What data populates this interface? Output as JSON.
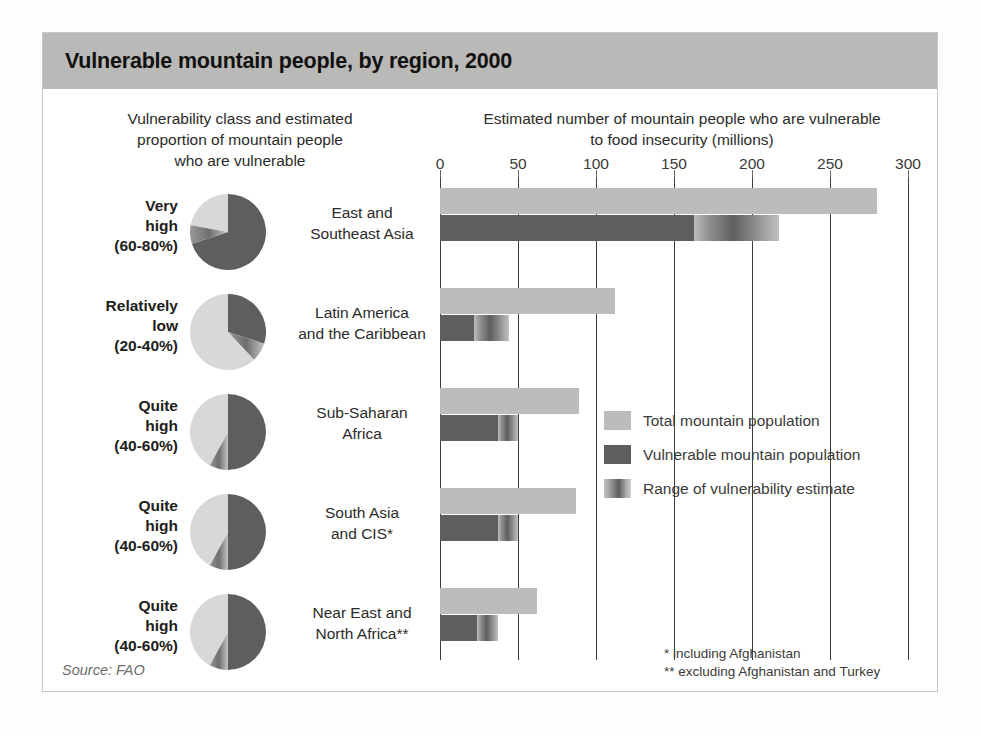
{
  "title": "Vulnerable mountain people, by region, 2000",
  "left_header": "Vulnerability class and estimated proportion of mountain people who are vulnerable",
  "left_header_lines": [
    "Vulnerability class and estimated",
    "proportion of mountain people",
    "who are vulnerable"
  ],
  "right_header_lines": [
    "Estimated number of mountain people who are vulnerable",
    "to food insecurity (millions)"
  ],
  "source": "Source: FAO",
  "footnotes": [
    "* including Afghanistan",
    "** excluding Afghanistan and Turkey"
  ],
  "legend": [
    {
      "key": "total",
      "label": "Total mountain population"
    },
    {
      "key": "vuln",
      "label": "Vulnerable mountain population"
    },
    {
      "key": "range",
      "label": "Range of vulnerability estimate"
    }
  ],
  "colors": {
    "title_band": "#b9b9b7",
    "total_bar": "#bcbcba",
    "vulnerable_bar": "#5e5e5c",
    "gridline": "#3d3d3b",
    "text": "#2b2b29"
  },
  "rows": [
    {
      "class_lines": [
        "Very",
        "high",
        "(60-80%)"
      ],
      "class_name": "Very high",
      "class_range": "(60-80%)",
      "region_lines": [
        "East and",
        "Southeast Asia"
      ],
      "region": "East and Southeast Asia",
      "pie_vulnerable_pct": 70
    },
    {
      "class_lines": [
        "Relatively",
        "low",
        "(20-40%)"
      ],
      "class_name": "Relatively low",
      "class_range": "(20-40%)",
      "region_lines": [
        "Latin America",
        "and the Caribbean"
      ],
      "region": "Latin America and the Caribbean",
      "pie_vulnerable_pct": 30
    },
    {
      "class_lines": [
        "Quite",
        "high",
        "(40-60%)"
      ],
      "class_name": "Quite high",
      "class_range": "(40-60%)",
      "region_lines": [
        "Sub-Saharan",
        "Africa"
      ],
      "region": "Sub-Saharan Africa",
      "pie_vulnerable_pct": 50
    },
    {
      "class_lines": [
        "Quite",
        "high",
        "(40-60%)"
      ],
      "class_name": "Quite high",
      "class_range": "(40-60%)",
      "region_lines": [
        "South Asia",
        "and CIS*"
      ],
      "region": "South Asia and CIS*",
      "pie_vulnerable_pct": 50
    },
    {
      "class_lines": [
        "Quite",
        "high",
        "(40-60%)"
      ],
      "class_name": "Quite high",
      "class_range": "(40-60%)",
      "region_lines": [
        "Near East and",
        "North Africa**"
      ],
      "region": "Near East and North Africa**",
      "pie_vulnerable_pct": 50
    }
  ],
  "chart_data": {
    "type": "bar",
    "title": "Vulnerable mountain people, by region, 2000",
    "subtitle": "Estimated number of mountain people who are vulnerable to food insecurity (millions)",
    "xlabel": "Estimated number of mountain people who are vulnerable to food insecurity (millions)",
    "ylabel": "",
    "orientation": "horizontal",
    "xlim": [
      0,
      300
    ],
    "xticks": [
      0,
      50,
      100,
      150,
      200,
      250,
      300
    ],
    "xtick_labels": [
      "0",
      "50",
      "100",
      "150",
      "200",
      "250",
      "300"
    ],
    "grid": true,
    "grid_axis": "x",
    "legend_position": "center-right",
    "categories": [
      "East and Southeast Asia",
      "Latin America and the Caribbean",
      "Sub-Saharan Africa",
      "South Asia and CIS*",
      "Near East and North Africa**"
    ],
    "series": [
      {
        "name": "Total mountain population",
        "values": [
          280,
          112,
          89,
          87,
          62
        ]
      },
      {
        "name": "Vulnerable mountain population",
        "values": [
          163,
          22,
          37,
          37,
          24
        ]
      }
    ],
    "range_of_vulnerability_estimate": {
      "name": "Range of vulnerability estimate",
      "low": [
        163,
        22,
        37,
        37,
        24
      ],
      "high": [
        217,
        44,
        50,
        50,
        37
      ]
    },
    "vulnerability_class": [
      {
        "region": "East and Southeast Asia",
        "class": "Very high",
        "proportion": "60-80%"
      },
      {
        "region": "Latin America and the Caribbean",
        "class": "Relatively low",
        "proportion": "20-40%"
      },
      {
        "region": "Sub-Saharan Africa",
        "class": "Quite high",
        "proportion": "40-60%"
      },
      {
        "region": "South Asia and CIS*",
        "class": "Quite high",
        "proportion": "40-60%"
      },
      {
        "region": "Near East and North Africa**",
        "class": "Quite high",
        "proportion": "40-60%"
      }
    ],
    "annotations": [
      "* including Afghanistan",
      "** excluding Afghanistan and Turkey",
      "Source: FAO"
    ]
  }
}
